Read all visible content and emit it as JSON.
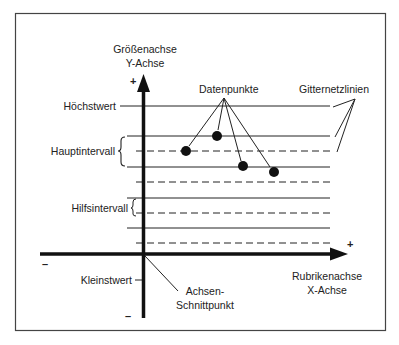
{
  "diagram": {
    "y_axis": {
      "title_line1": "Größenachse",
      "title_line2": "Y-Achse",
      "plus": "+",
      "minus": "–"
    },
    "x_axis": {
      "title_line1": "Rubrikenachse",
      "title_line2": "X-Achse",
      "plus": "+",
      "minus": "–"
    },
    "labels": {
      "max_value": "Höchstwert",
      "major_interval": "Hauptintervall",
      "minor_interval": "Hilfsintervall",
      "min_value": "Kleinstwert",
      "axis_intersection_line1": "Achsen-",
      "axis_intersection_line2": "Schnittpunkt",
      "data_points": "Datenpunkte",
      "gridlines": "Gitternetzlinien"
    },
    "gridlines": {
      "major_y": [
        106,
        136,
        167,
        198,
        228
      ],
      "minor_y": [
        151,
        182,
        213,
        243
      ]
    },
    "data_points": [
      {
        "x": 186,
        "y": 151
      },
      {
        "x": 217,
        "y": 136
      },
      {
        "x": 243,
        "y": 166
      },
      {
        "x": 274,
        "y": 172
      }
    ],
    "colors": {
      "ink": "#111111",
      "frame": "#444444"
    }
  }
}
